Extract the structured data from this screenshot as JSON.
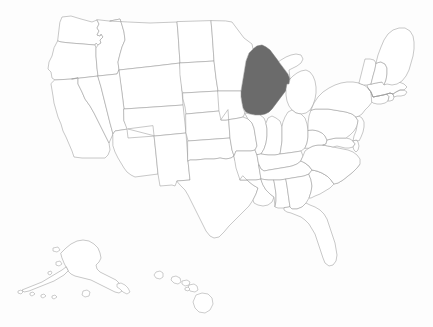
{
  "map": {
    "title": "United States choropleth map",
    "projection": "albers-usa",
    "background_color": "#fdfdfd",
    "default_fill": "#ffffff",
    "border_color": "#9a9a9a",
    "selected_fill": "#6b6b6b",
    "selected_states": [
      "WI"
    ],
    "insets": [
      "AK",
      "HI"
    ],
    "states": [
      {
        "code": "WA",
        "name": "Washington",
        "selected": false
      },
      {
        "code": "OR",
        "name": "Oregon",
        "selected": false
      },
      {
        "code": "CA",
        "name": "California",
        "selected": false
      },
      {
        "code": "NV",
        "name": "Nevada",
        "selected": false
      },
      {
        "code": "ID",
        "name": "Idaho",
        "selected": false
      },
      {
        "code": "MT",
        "name": "Montana",
        "selected": false
      },
      {
        "code": "WY",
        "name": "Wyoming",
        "selected": false
      },
      {
        "code": "UT",
        "name": "Utah",
        "selected": false
      },
      {
        "code": "AZ",
        "name": "Arizona",
        "selected": false
      },
      {
        "code": "CO",
        "name": "Colorado",
        "selected": false
      },
      {
        "code": "NM",
        "name": "New Mexico",
        "selected": false
      },
      {
        "code": "ND",
        "name": "North Dakota",
        "selected": false
      },
      {
        "code": "SD",
        "name": "South Dakota",
        "selected": false
      },
      {
        "code": "NE",
        "name": "Nebraska",
        "selected": false
      },
      {
        "code": "KS",
        "name": "Kansas",
        "selected": false
      },
      {
        "code": "OK",
        "name": "Oklahoma",
        "selected": false
      },
      {
        "code": "TX",
        "name": "Texas",
        "selected": false
      },
      {
        "code": "MN",
        "name": "Minnesota",
        "selected": false
      },
      {
        "code": "IA",
        "name": "Iowa",
        "selected": false
      },
      {
        "code": "MO",
        "name": "Missouri",
        "selected": false
      },
      {
        "code": "AR",
        "name": "Arkansas",
        "selected": false
      },
      {
        "code": "LA",
        "name": "Louisiana",
        "selected": false
      },
      {
        "code": "WI",
        "name": "Wisconsin",
        "selected": true
      },
      {
        "code": "IL",
        "name": "Illinois",
        "selected": false
      },
      {
        "code": "MI",
        "name": "Michigan",
        "selected": false
      },
      {
        "code": "IN",
        "name": "Indiana",
        "selected": false
      },
      {
        "code": "OH",
        "name": "Ohio",
        "selected": false
      },
      {
        "code": "KY",
        "name": "Kentucky",
        "selected": false
      },
      {
        "code": "TN",
        "name": "Tennessee",
        "selected": false
      },
      {
        "code": "MS",
        "name": "Mississippi",
        "selected": false
      },
      {
        "code": "AL",
        "name": "Alabama",
        "selected": false
      },
      {
        "code": "GA",
        "name": "Georgia",
        "selected": false
      },
      {
        "code": "FL",
        "name": "Florida",
        "selected": false
      },
      {
        "code": "SC",
        "name": "South Carolina",
        "selected": false
      },
      {
        "code": "NC",
        "name": "North Carolina",
        "selected": false
      },
      {
        "code": "VA",
        "name": "Virginia",
        "selected": false
      },
      {
        "code": "WV",
        "name": "West Virginia",
        "selected": false
      },
      {
        "code": "MD",
        "name": "Maryland",
        "selected": false
      },
      {
        "code": "DE",
        "name": "Delaware",
        "selected": false
      },
      {
        "code": "PA",
        "name": "Pennsylvania",
        "selected": false
      },
      {
        "code": "NJ",
        "name": "New Jersey",
        "selected": false
      },
      {
        "code": "NY",
        "name": "New York",
        "selected": false
      },
      {
        "code": "CT",
        "name": "Connecticut",
        "selected": false
      },
      {
        "code": "RI",
        "name": "Rhode Island",
        "selected": false
      },
      {
        "code": "MA",
        "name": "Massachusetts",
        "selected": false
      },
      {
        "code": "VT",
        "name": "Vermont",
        "selected": false
      },
      {
        "code": "NH",
        "name": "New Hampshire",
        "selected": false
      },
      {
        "code": "ME",
        "name": "Maine",
        "selected": false
      },
      {
        "code": "AK",
        "name": "Alaska",
        "selected": false
      },
      {
        "code": "HI",
        "name": "Hawaii",
        "selected": false
      }
    ]
  }
}
